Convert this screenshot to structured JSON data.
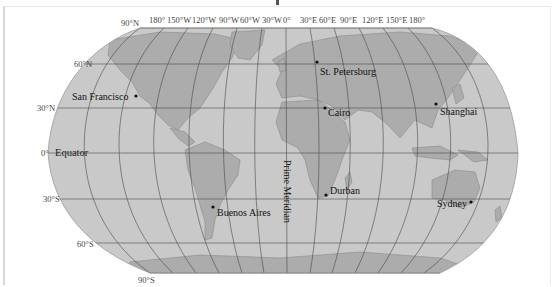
{
  "map": {
    "projection": "Robinson",
    "colors": {
      "ocean": "#c9c9c9",
      "land": "#a9a9a9",
      "grid": "#4a4a4a",
      "outline": "#8a8a8a",
      "background": "#ffffff"
    },
    "longitude_labels": [
      "90°N",
      "180°",
      "150°W",
      "120°W",
      "90°W",
      "60°W",
      "30°W",
      "0°",
      "30°E",
      "60°E",
      "90°E",
      "120°E",
      "150°E",
      "180°"
    ],
    "latitude_labels": {
      "n60": "60°N",
      "n30": "30°N",
      "eq": "0°",
      "s30": "30°S",
      "s60": "60°S",
      "s90": "90°S"
    },
    "equator_label": "Equator",
    "prime_meridian_label": "Prime Meridian",
    "cities": [
      {
        "name": "San Francisco"
      },
      {
        "name": "St. Petersburg"
      },
      {
        "name": "Cairo"
      },
      {
        "name": "Shanghai"
      },
      {
        "name": "Durban"
      },
      {
        "name": "Buenos Aires"
      },
      {
        "name": "Sydney"
      }
    ]
  }
}
